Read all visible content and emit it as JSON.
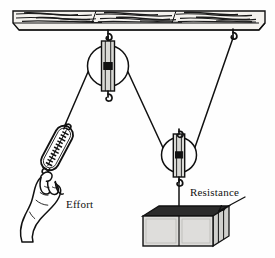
{
  "figure": {
    "labels": {
      "effort": "Effort",
      "resistance": "Resistance"
    },
    "colors": {
      "ink": "#111111",
      "beam_fill": "#f2f0ec",
      "beam_grain": "#1a1a1a",
      "pulley_frame_fill": "#d8d8d4",
      "pulley_axle": "#111111",
      "wheel_fill": "#ffffff",
      "block_front": "#dcdcda",
      "block_top": "#2a2a2a",
      "block_side": "#cfcfcc",
      "scale_fill": "#ffffff",
      "hand_fill": "#ffffff",
      "background": "#fefefe"
    },
    "parts": [
      {
        "name": "ceiling-beam",
        "kind": "support",
        "x": 13,
        "y": 10,
        "width": 252,
        "height": 20
      },
      {
        "name": "ceiling-hook-left",
        "kind": "hook",
        "x": 108,
        "y": 32
      },
      {
        "name": "ceiling-hook-right",
        "kind": "hook",
        "x": 233,
        "y": 31
      },
      {
        "name": "fixed-pulley",
        "kind": "pulley",
        "cx": 108,
        "cy": 66,
        "r": 21
      },
      {
        "name": "movable-pulley",
        "kind": "pulley",
        "cx": 179,
        "cy": 155,
        "r": 18
      },
      {
        "name": "spring-scale",
        "kind": "spring-scale",
        "cx": 57,
        "cy": 148,
        "angle": 28
      },
      {
        "name": "hand",
        "kind": "hand",
        "x": 18,
        "y": 172
      },
      {
        "name": "load-block",
        "kind": "block",
        "x": 143,
        "y": 212,
        "width": 70,
        "height": 34
      }
    ],
    "ropes": [
      {
        "name": "rope-effort-segment",
        "from": "fixed-pulley-left",
        "to": "spring-scale-top"
      },
      {
        "name": "rope-pulley-to-movable",
        "from": "fixed-pulley-right",
        "to": "movable-pulley-left"
      },
      {
        "name": "rope-ceiling-to-movable",
        "from": "ceiling-hook-right",
        "to": "movable-pulley-right"
      },
      {
        "name": "rope-movable-to-block",
        "from": "movable-pulley-hook",
        "to": "load-block-top"
      }
    ],
    "annotations": [
      {
        "name": "resistance-leader",
        "from_x": 207,
        "from_y": 198,
        "to_x": 218,
        "to_y": 211
      }
    ]
  }
}
